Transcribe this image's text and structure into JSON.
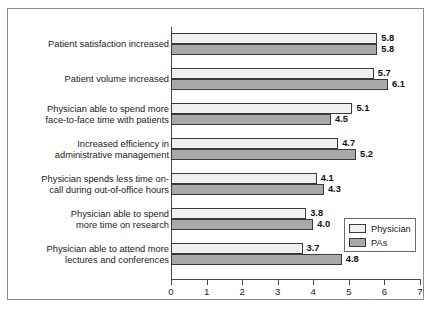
{
  "chart_data": {
    "type": "bar",
    "orientation": "horizontal",
    "title": "",
    "xlabel": "",
    "ylabel": "",
    "xlim": [
      0,
      7
    ],
    "xticks": [
      "0",
      "1",
      "2",
      "3",
      "4",
      "5",
      "6",
      "7"
    ],
    "grid": false,
    "legend_position": "bottom-right",
    "categories": [
      "Patient satisfaction increased",
      "Patient volume increased",
      "Physician able to spend more\nface-to-face time with patients",
      "Increased efficiency in\nadministrative management",
      "Physician spends less time on-\ncall during out-of-office hours",
      "Physician able to spend\nmore time on research",
      "Physician able to attend more\nlectures and conferences"
    ],
    "series": [
      {
        "name": "Physician",
        "color": "#f0f0f0",
        "values": [
          5.8,
          5.7,
          5.1,
          4.7,
          4.1,
          3.8,
          3.7
        ],
        "labels": [
          "5.8",
          "5.7",
          "5.1",
          "4.7",
          "4.1",
          "3.8",
          "3.7"
        ]
      },
      {
        "name": "PAs",
        "color": "#a9a9a9",
        "values": [
          5.8,
          6.1,
          4.5,
          5.2,
          4.3,
          4.0,
          4.8
        ],
        "labels": [
          "5.8",
          "6.1",
          "4.5",
          "5.2",
          "4.3",
          "4.0",
          "4.8"
        ]
      }
    ]
  },
  "legend": {
    "entries": [
      {
        "label": "Physician",
        "swatch": "physician"
      },
      {
        "label": "PAs",
        "swatch": "pas"
      }
    ]
  }
}
